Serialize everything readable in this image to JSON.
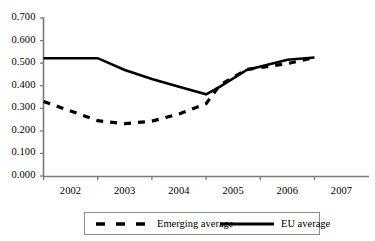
{
  "chart_data": {
    "type": "line",
    "title": "",
    "xlabel": "",
    "ylabel": "",
    "x": [
      2002,
      2002.5,
      2003,
      2003.5,
      2004,
      2004.5,
      2005,
      2005.25,
      2005.75,
      2006.5,
      2007
    ],
    "xlim": [
      2002,
      2007
    ],
    "ylim": [
      0.0,
      0.7
    ],
    "ytick_labels": [
      "0.700",
      "0.600",
      "0.500",
      "0.400",
      "0.300",
      "0.200",
      "0.100",
      "0.000"
    ],
    "ytick_values": [
      0.7,
      0.6,
      0.5,
      0.4,
      0.3,
      0.2,
      0.1,
      0.0
    ],
    "xtick_labels": [
      "2002",
      "2003",
      "2004",
      "2005",
      "2006",
      "2007"
    ],
    "xtick_values": [
      2002,
      2003,
      2004,
      2005,
      2006,
      2007
    ],
    "grid": false,
    "legend_position": "bottom",
    "series": [
      {
        "name": "Emerging average",
        "style": "dashed",
        "color": "#000000",
        "values": [
          0.33,
          0.288,
          0.245,
          0.232,
          0.243,
          0.275,
          0.32,
          0.402,
          0.472,
          0.498,
          0.525
        ]
      },
      {
        "name": "EU average",
        "style": "solid",
        "color": "#000000",
        "values": [
          0.522,
          0.522,
          0.522,
          0.47,
          0.43,
          0.395,
          0.362,
          0.395,
          0.47,
          0.515,
          0.525
        ]
      }
    ]
  },
  "legend": {
    "items": [
      {
        "label": "Emerging average",
        "style": "dashed"
      },
      {
        "label": "EU average",
        "style": "solid"
      }
    ]
  },
  "axis": {
    "line_color": "#7a7a7a"
  }
}
